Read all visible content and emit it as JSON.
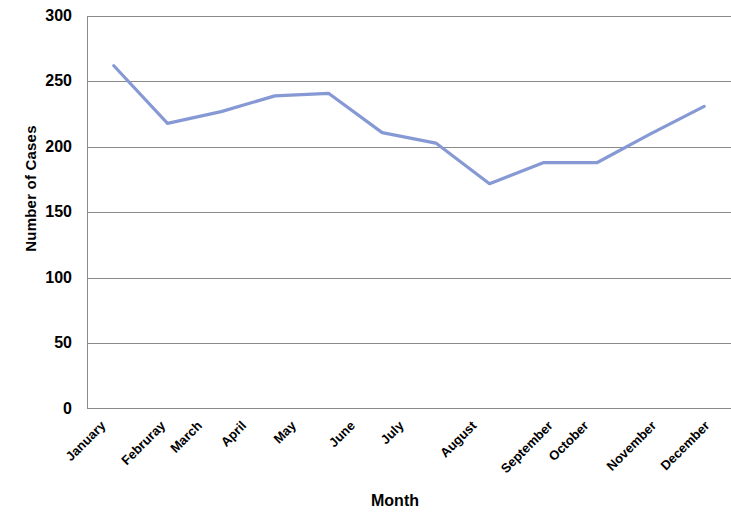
{
  "chart_data": {
    "type": "line",
    "title": "",
    "xlabel": "Month",
    "ylabel": "Number of Cases",
    "categories": [
      "January",
      "Februray",
      "March",
      "April",
      "May",
      "June",
      "July",
      "August",
      "September",
      "October",
      "November",
      "December"
    ],
    "values": [
      262,
      218,
      227,
      239,
      241,
      211,
      203,
      172,
      188,
      188,
      210,
      231
    ],
    "series": [
      {
        "name": "Number of Cases",
        "values": [
          262,
          218,
          227,
          239,
          241,
          211,
          203,
          172,
          188,
          188,
          210,
          231
        ],
        "color": "#8699d4"
      }
    ],
    "ylim": [
      0,
      300
    ],
    "y_ticks": [
      0,
      50,
      100,
      150,
      200,
      250,
      300
    ],
    "y_tick_labels": [
      "0",
      "50",
      "100",
      "150",
      "200",
      "250",
      "300"
    ],
    "grid": true,
    "grid_axis": "y",
    "legend": false,
    "legend_position": "none",
    "markers": false,
    "line_color": "#8699d4",
    "gridline_color": "#868686",
    "axis_color": "#868686",
    "background_color": "#ffffff",
    "x_tick_label_rotation": -45
  }
}
